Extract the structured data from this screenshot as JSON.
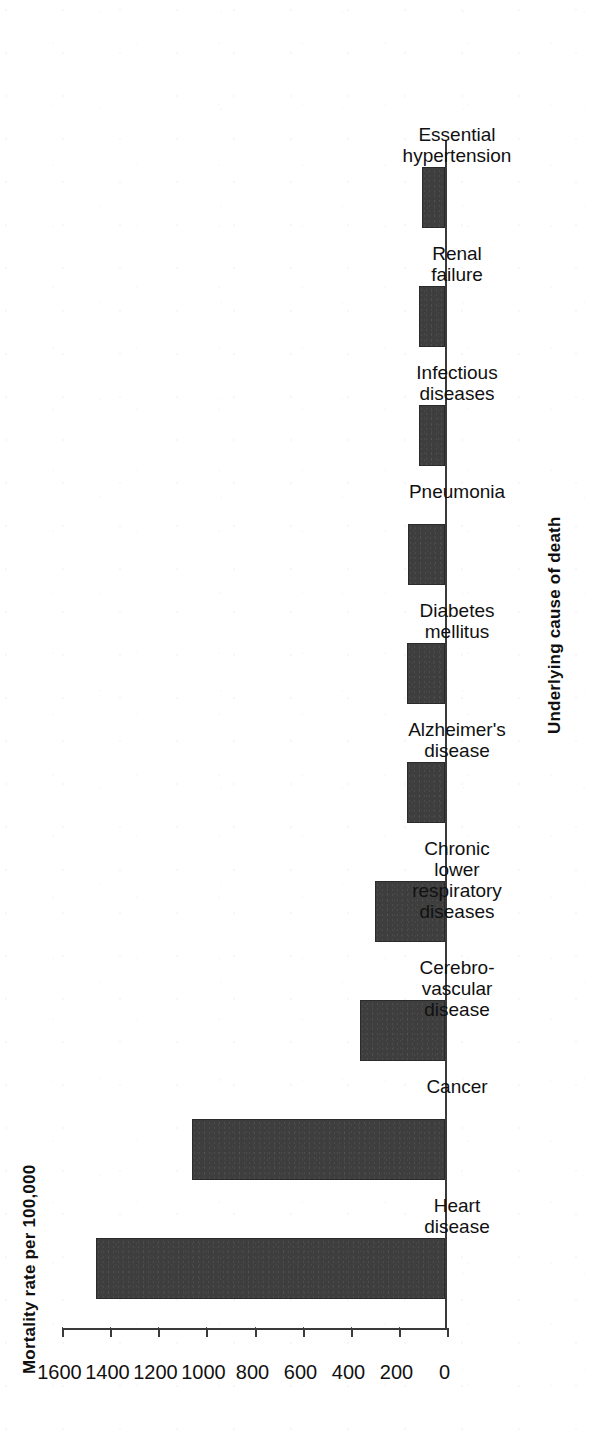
{
  "chart_data": {
    "type": "bar",
    "orientation": "horizontal",
    "title": "",
    "xlabel": "Underlying cause of death",
    "ylabel": "Mortality rate per 100,000",
    "ylim": [
      0,
      1600
    ],
    "ytick_labels": [
      "1600",
      "1400",
      "1200",
      "1000",
      "800",
      "600",
      "400",
      "200",
      "0"
    ],
    "ytick_values": [
      1600,
      1400,
      1200,
      1000,
      800,
      600,
      400,
      200,
      0
    ],
    "grid": true,
    "legend": null,
    "bar_color": "#3e3e3e",
    "categories": [
      "Heart disease",
      "Cancer",
      "Cerebro-vascular disease",
      "Chronic lower respiratory diseases",
      "Alzheimer's disease",
      "Diabetes mellitus",
      "Pneumonia",
      "Infectious diseases",
      "Renal failure",
      "Essential hypertension"
    ],
    "category_label_lines": [
      [
        "Heart",
        "disease"
      ],
      [
        "Cancer"
      ],
      [
        "Cerebro-",
        "vascular",
        "disease"
      ],
      [
        "Chronic",
        "lower",
        "respiratory",
        "diseases"
      ],
      [
        "Alzheimer's",
        "disease"
      ],
      [
        "Diabetes",
        "mellitus"
      ],
      [
        "Pneumonia"
      ],
      [
        "Infectious",
        "diseases"
      ],
      [
        "Renal",
        "failure"
      ],
      [
        "Essential",
        "hypertension"
      ]
    ],
    "values": [
      1450,
      1050,
      355,
      290,
      160,
      160,
      155,
      110,
      110,
      95
    ]
  },
  "axes": {
    "value_axis_title": "Mortality rate per 100,000",
    "category_axis_title": "Underlying cause of death"
  }
}
